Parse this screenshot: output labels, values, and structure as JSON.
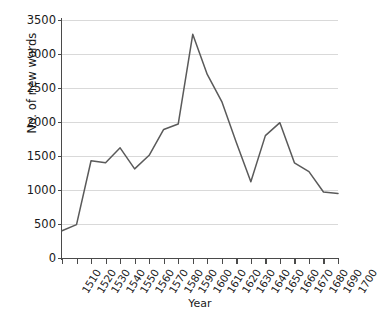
{
  "chart_data": {
    "type": "line",
    "title": "",
    "xlabel": "Year",
    "ylabel": "No. of new words",
    "grid": true,
    "legend": false,
    "xlim": [
      1510,
      1700
    ],
    "ylim": [
      0,
      3500
    ],
    "ytick_labels": [
      "0",
      "500",
      "1000",
      "1500",
      "2000",
      "2500",
      "3000",
      "3500"
    ],
    "ytick_values": [
      0,
      500,
      1000,
      1500,
      2000,
      2500,
      3000,
      3500
    ],
    "categories": [
      "1510",
      "1520",
      "1530",
      "1540",
      "1550",
      "1560",
      "1570",
      "1580",
      "1590",
      "1600",
      "1610",
      "1620",
      "1630",
      "1640",
      "1650",
      "1660",
      "1670",
      "1680",
      "1690",
      "1700"
    ],
    "x": [
      1510,
      1520,
      1530,
      1540,
      1550,
      1560,
      1570,
      1580,
      1590,
      1600,
      1610,
      1620,
      1630,
      1640,
      1650,
      1660,
      1670,
      1680,
      1690,
      1700
    ],
    "values": [
      400,
      490,
      1430,
      1400,
      1620,
      1310,
      1510,
      1890,
      1970,
      3290,
      2700,
      2300,
      1700,
      1120,
      1800,
      1990,
      1400,
      1270,
      970,
      950
    ],
    "series": [
      {
        "name": "No. of new words",
        "color": "#5a5a5a",
        "values": [
          400,
          490,
          1430,
          1400,
          1620,
          1310,
          1510,
          1890,
          1970,
          3290,
          2700,
          2300,
          1700,
          1120,
          1800,
          1990,
          1400,
          1270,
          970,
          950
        ]
      }
    ],
    "colors": {
      "line": "#5a5a5a",
      "grid": "#d9d9d9",
      "axis": "#4a4a4a",
      "text": "#1a1a1a",
      "background": "#ffffff"
    }
  }
}
